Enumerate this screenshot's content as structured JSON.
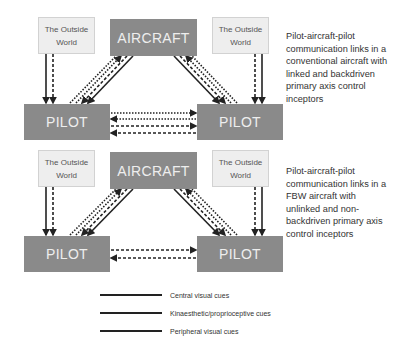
{
  "diagrams": [
    {
      "outside_left": {
        "line1": "The Outside",
        "line2": "World"
      },
      "aircraft": "AIRCRAFT",
      "pilot_left": "PILOT",
      "pilot_right": "PILOT",
      "outside_right": {
        "line1": "The Outside",
        "line2": "World"
      },
      "caption": "Pilot-aircraft-pilot communication links in a conventional aircraft with linked and backdriven primary axis control inceptors"
    },
    {
      "outside_left": {
        "line1": "The Outside",
        "line2": "World"
      },
      "aircraft": "AIRCRAFT",
      "pilot_left": "PILOT",
      "pilot_right": "PILOT",
      "outside_right": {
        "line1": "The Outside",
        "line2": "World"
      },
      "caption": "Pilot-aircraft-pilot communication links in a FBW aircraft with unlinked and non-backdriven primary axis control inceptors"
    }
  ],
  "legend": [
    {
      "label": "Central visual cues",
      "style": "solid"
    },
    {
      "label": "Kinaesthetic/proprioceptive cues",
      "style": "solid"
    },
    {
      "label": "Peripheral visual cues",
      "style": "solid"
    }
  ],
  "colors": {
    "box_dark": "#8a8a8a",
    "box_light": "#eeeeee",
    "line": "#222222"
  }
}
